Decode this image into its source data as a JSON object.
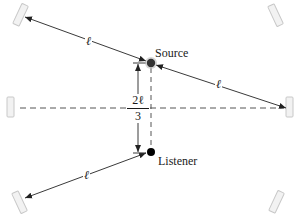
{
  "diagram": {
    "type": "acoustic-reflection-geometry",
    "labels": {
      "source": "Source",
      "listener": "Listener",
      "segment_top_left": "ℓ",
      "segment_top_right": "ℓ",
      "segment_bottom_left": "ℓ",
      "vertical_distance_numerator": "2ℓ",
      "vertical_distance_denominator": "3"
    },
    "colors": {
      "line": "#3a3a3a",
      "dashed": "#555555",
      "source_fill": "#333333",
      "listener_fill": "#000000",
      "mirror_fill": "#f2f2f2",
      "mirror_stroke": "#c8c8c8"
    },
    "points": {
      "source": {
        "x": 151,
        "y": 63
      },
      "listener": {
        "x": 151,
        "y": 152
      }
    },
    "reflectors": [
      {
        "name": "top-left",
        "x": 21,
        "y": 15,
        "angle": 25
      },
      {
        "name": "top-right",
        "x": 276,
        "y": 15,
        "angle": -25
      },
      {
        "name": "left",
        "x": 11,
        "y": 107,
        "angle": 0
      },
      {
        "name": "right",
        "x": 290,
        "y": 107,
        "angle": 0
      },
      {
        "name": "bottom-left",
        "x": 20,
        "y": 202,
        "angle": -25
      },
      {
        "name": "bottom-right",
        "x": 277,
        "y": 202,
        "angle": 25
      }
    ]
  }
}
